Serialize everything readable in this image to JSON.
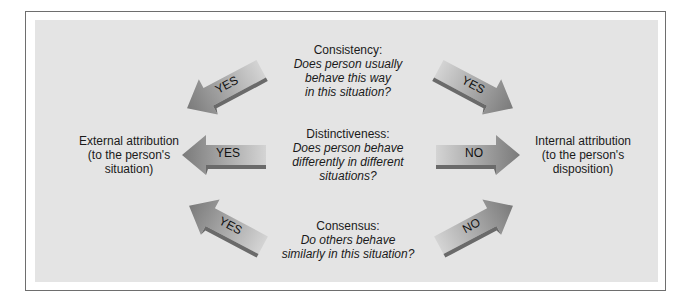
{
  "diagram": {
    "left_outcome": {
      "title": "External attribution",
      "sub1": "(to the person's",
      "sub2": "situation)"
    },
    "right_outcome": {
      "title": "Internal attribution",
      "sub1": "(to the person's",
      "sub2": "disposition)"
    },
    "questions": [
      {
        "heading": "Consistency:",
        "lines": [
          "Does person usually",
          "behave this way",
          "in this situation?"
        ],
        "left_arrow": "YES",
        "right_arrow": "YES"
      },
      {
        "heading": "Distinctiveness:",
        "lines": [
          "Does person behave",
          "differently in different",
          "situations?"
        ],
        "left_arrow": "YES",
        "right_arrow": "NO"
      },
      {
        "heading": "Consensus:",
        "lines": [
          "Do others behave",
          "similarly in this situation?"
        ],
        "left_arrow": "YES",
        "right_arrow": "NO"
      }
    ],
    "colors": {
      "panel": "#e4e4e4",
      "frame": "#6e6e6e",
      "arrow_light": "#cfcfcf",
      "arrow_dark": "#7a7a7a"
    }
  }
}
